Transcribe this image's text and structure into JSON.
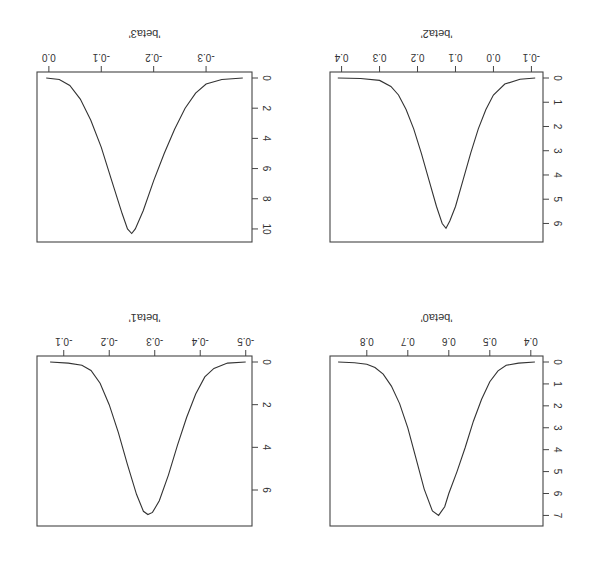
{
  "figure": {
    "orientation_deg": 180,
    "title_partial": ""
  },
  "chart_data": [
    {
      "type": "line",
      "title": "",
      "xlabel": "'beta0'",
      "ylabel": "",
      "xlim": [
        0.38,
        0.88
      ],
      "ylim": [
        0,
        7.3
      ],
      "xticks": [
        0.4,
        0.5,
        0.6,
        0.7,
        0.8
      ],
      "xtick_labels": [
        "0.4",
        "0.5",
        "0.6",
        "0.7",
        "0.8"
      ],
      "yticks": [
        0,
        1,
        2,
        3,
        4,
        5,
        6,
        7
      ],
      "ytick_labels": [
        "0",
        "1",
        "2",
        "3",
        "4",
        "5",
        "6",
        "7"
      ],
      "series": [
        {
          "name": "density",
          "x": [
            0.39,
            0.43,
            0.46,
            0.48,
            0.5,
            0.52,
            0.54,
            0.56,
            0.58,
            0.6,
            0.61,
            0.625,
            0.64,
            0.66,
            0.68,
            0.7,
            0.72,
            0.74,
            0.76,
            0.78,
            0.8,
            0.83,
            0.87
          ],
          "y": [
            0.0,
            0.05,
            0.15,
            0.4,
            0.9,
            1.7,
            2.7,
            3.9,
            5.0,
            6.0,
            6.6,
            7.0,
            6.8,
            5.8,
            4.4,
            3.0,
            1.9,
            1.1,
            0.55,
            0.25,
            0.1,
            0.03,
            0.0
          ]
        }
      ]
    },
    {
      "type": "line",
      "title": "",
      "xlabel": "'beta1'",
      "ylabel": "",
      "xlim": [
        -0.505,
        -0.05
      ],
      "ylim": [
        0,
        7.5
      ],
      "xticks": [
        -0.5,
        -0.4,
        -0.3,
        -0.2,
        -0.1
      ],
      "xtick_labels": [
        "-0.5",
        "-0.4",
        "-0.3",
        "-0.2",
        "-0.1"
      ],
      "yticks": [
        0,
        2,
        4,
        6
      ],
      "ytick_labels": [
        "0",
        "2",
        "4",
        "6"
      ],
      "series": [
        {
          "name": "density",
          "x": [
            -0.5,
            -0.46,
            -0.43,
            -0.41,
            -0.39,
            -0.37,
            -0.35,
            -0.33,
            -0.31,
            -0.295,
            -0.285,
            -0.275,
            -0.26,
            -0.24,
            -0.22,
            -0.2,
            -0.18,
            -0.16,
            -0.14,
            -0.11,
            -0.07
          ],
          "y": [
            0.0,
            0.05,
            0.3,
            0.7,
            1.5,
            2.6,
            3.9,
            5.3,
            6.5,
            7.05,
            7.15,
            7.0,
            6.2,
            4.8,
            3.3,
            2.0,
            1.0,
            0.4,
            0.15,
            0.05,
            0.0
          ]
        }
      ]
    },
    {
      "type": "line",
      "title": "",
      "xlabel": "'beta2'",
      "ylabel": "",
      "xlim": [
        -0.12,
        0.42
      ],
      "ylim": [
        0,
        6.6
      ],
      "xticks": [
        -0.1,
        0.0,
        0.1,
        0.2,
        0.3,
        0.4
      ],
      "xtick_labels": [
        "-0.1",
        "0.0",
        "0.1",
        "0.2",
        "0.3",
        "0.4"
      ],
      "yticks": [
        0,
        1,
        2,
        3,
        4,
        5,
        6
      ],
      "ytick_labels": [
        "0",
        "1",
        "2",
        "3",
        "4",
        "5",
        "6"
      ],
      "series": [
        {
          "name": "density",
          "x": [
            -0.11,
            -0.07,
            -0.03,
            0.0,
            0.02,
            0.04,
            0.06,
            0.08,
            0.1,
            0.115,
            0.125,
            0.135,
            0.15,
            0.17,
            0.19,
            0.21,
            0.23,
            0.25,
            0.27,
            0.3,
            0.35,
            0.41
          ],
          "y": [
            0.0,
            0.05,
            0.25,
            0.7,
            1.3,
            2.1,
            3.1,
            4.2,
            5.3,
            5.9,
            6.2,
            6.0,
            5.3,
            4.2,
            3.1,
            2.1,
            1.3,
            0.7,
            0.35,
            0.1,
            0.02,
            0.0
          ]
        }
      ]
    },
    {
      "type": "line",
      "title": "",
      "xlabel": "'beta3'",
      "ylabel": "",
      "xlim": [
        -0.38,
        0.015
      ],
      "ylim": [
        0,
        10.6
      ],
      "xticks": [
        -0.3,
        -0.2,
        -0.1,
        0.0
      ],
      "xtick_labels": [
        "-0.3",
        "-0.2",
        "-0.1",
        "0.0"
      ],
      "yticks": [
        0,
        2,
        4,
        6,
        8,
        10
      ],
      "ytick_labels": [
        "0",
        "2",
        "4",
        "6",
        "8",
        "10"
      ],
      "series": [
        {
          "name": "density",
          "x": [
            -0.37,
            -0.33,
            -0.3,
            -0.28,
            -0.26,
            -0.24,
            -0.22,
            -0.2,
            -0.18,
            -0.165,
            -0.158,
            -0.15,
            -0.14,
            -0.12,
            -0.1,
            -0.08,
            -0.06,
            -0.04,
            -0.02,
            0.005
          ],
          "y": [
            0.0,
            0.1,
            0.4,
            1.0,
            2.0,
            3.4,
            5.0,
            6.8,
            8.8,
            10.0,
            10.3,
            10.0,
            9.0,
            6.8,
            4.6,
            2.8,
            1.4,
            0.5,
            0.1,
            0.0
          ]
        }
      ]
    }
  ]
}
